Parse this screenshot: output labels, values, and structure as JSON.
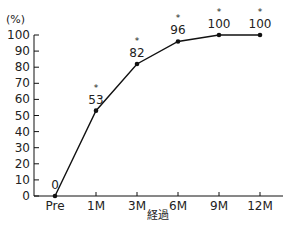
{
  "chart_data": {
    "type": "line",
    "title": "",
    "xlabel": "経過",
    "ylabel": "(%)",
    "categories": [
      "Pre",
      "1M",
      "3M",
      "6M",
      "9M",
      "12M"
    ],
    "series": [
      {
        "name": "",
        "values": [
          0,
          53,
          82,
          96,
          100,
          100
        ],
        "data_labels": [
          "0",
          "53",
          "82",
          "96",
          "100",
          "100"
        ],
        "significance": [
          "",
          "*",
          "*",
          "*",
          "*",
          "*"
        ]
      }
    ],
    "ylim": [
      0,
      100
    ],
    "yticks": [
      0,
      10,
      20,
      30,
      40,
      50,
      60,
      70,
      80,
      90,
      100
    ],
    "grid": false,
    "legend": null,
    "color": "#111111"
  }
}
